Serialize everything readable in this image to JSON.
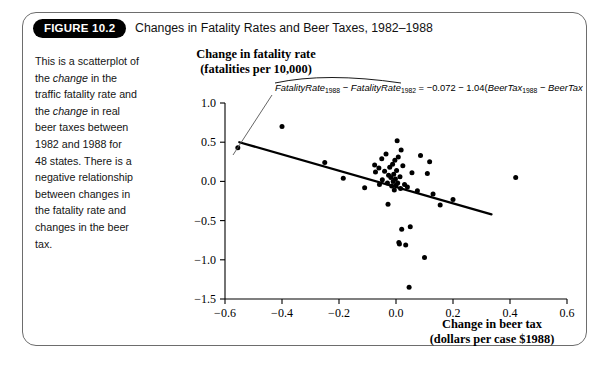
{
  "figure": {
    "badge": "FIGURE 10.2",
    "title": "Changes in Fatality Rates and Beer Taxes, 1982–1988",
    "caption_lines": [
      "This is a scatterplot of",
      "the change in the",
      "traffic fatality rate and",
      "the change in real",
      "beer taxes between",
      "1982 and 1988 for",
      "48 states. There is a",
      "negative relationship",
      "between changes in",
      "the fatality rate and",
      "changes in the beer",
      "tax."
    ]
  },
  "annotation": {
    "equation_plain": "FatalityRate1988 − FatalityRate1982 = −0.072 − 1.04(BeerTax1988 − BeerTax1982)",
    "term1": "FatalityRate",
    "sub1": "1988",
    "minus": "−",
    "term2": "FatalityRate",
    "sub2": "1982",
    "equals": "=",
    "intercept": "−0.072",
    "slope_sign": "−",
    "slope": "1.04(",
    "term3": "BeerTax",
    "sub3": "1988",
    "term4": "BeerTax",
    "sub4": "1982",
    "close": ")"
  },
  "chart_data": {
    "type": "scatter",
    "xlabel_line1": "Change in beer tax",
    "xlabel_line2": "(dollars per case $1988)",
    "ylabel_line1": "Change in fatality rate",
    "ylabel_line2": "(fatalities per 10,000)",
    "xlim": [
      -0.6,
      0.6
    ],
    "ylim": [
      -1.5,
      1.0
    ],
    "xticks": [
      -0.6,
      -0.4,
      -0.2,
      0.0,
      0.2,
      0.4,
      0.6
    ],
    "xticklabels": [
      "−0.6",
      "−0.4",
      "−0.2",
      "0.0",
      "0.2",
      "0.4",
      "0.6"
    ],
    "yticks": [
      1.0,
      0.5,
      0.0,
      -0.5,
      -1.0,
      -1.5
    ],
    "yticklabels": [
      "1.0",
      "0.5",
      "0.0",
      "−0.5",
      "−1.0",
      "−1.5"
    ],
    "grid": false,
    "legend": "none",
    "marker_color": "#000000",
    "line_color": "#000000",
    "regression": {
      "intercept": -0.072,
      "slope": -1.04,
      "x_start": -0.55,
      "x_end": 0.335
    },
    "points": [
      [
        -0.555,
        0.43
      ],
      [
        -0.4,
        0.7
      ],
      [
        -0.25,
        0.24
      ],
      [
        -0.185,
        0.04
      ],
      [
        -0.11,
        -0.08
      ],
      [
        -0.075,
        0.21
      ],
      [
        -0.072,
        0.12
      ],
      [
        -0.06,
        0.17
      ],
      [
        -0.058,
        -0.04
      ],
      [
        -0.05,
        0.29
      ],
      [
        -0.048,
        0.02
      ],
      [
        -0.04,
        0.13
      ],
      [
        -0.035,
        0.35
      ],
      [
        -0.03,
        -0.02
      ],
      [
        -0.028,
        -0.29
      ],
      [
        -0.026,
        0.08
      ],
      [
        -0.022,
        0.18
      ],
      [
        -0.018,
        0.05
      ],
      [
        -0.015,
        -0.06
      ],
      [
        -0.012,
        0.22
      ],
      [
        -0.01,
        0.0
      ],
      [
        -0.008,
        0.09
      ],
      [
        -0.006,
        -0.11
      ],
      [
        -0.004,
        0.27
      ],
      [
        -0.002,
        0.03
      ],
      [
        0.0,
        -0.05
      ],
      [
        0.002,
        0.14
      ],
      [
        0.004,
        0.52
      ],
      [
        0.006,
        -0.02
      ],
      [
        0.008,
        0.31
      ],
      [
        0.01,
        -0.78
      ],
      [
        0.012,
        -0.8
      ],
      [
        0.014,
        0.06
      ],
      [
        0.016,
        -0.09
      ],
      [
        0.018,
        0.4
      ],
      [
        0.02,
        -0.61
      ],
      [
        0.024,
        0.2
      ],
      [
        0.03,
        -0.04
      ],
      [
        0.034,
        -0.81
      ],
      [
        0.04,
        -0.07
      ],
      [
        0.046,
        -1.35
      ],
      [
        0.05,
        -0.58
      ],
      [
        0.056,
        0.11
      ],
      [
        0.075,
        -0.12
      ],
      [
        0.086,
        0.33
      ],
      [
        0.1,
        -0.97
      ],
      [
        0.11,
        0.1
      ],
      [
        0.118,
        0.25
      ],
      [
        0.13,
        -0.16
      ],
      [
        0.155,
        -0.3
      ],
      [
        0.2,
        -0.23
      ],
      [
        0.42,
        0.05
      ]
    ]
  }
}
